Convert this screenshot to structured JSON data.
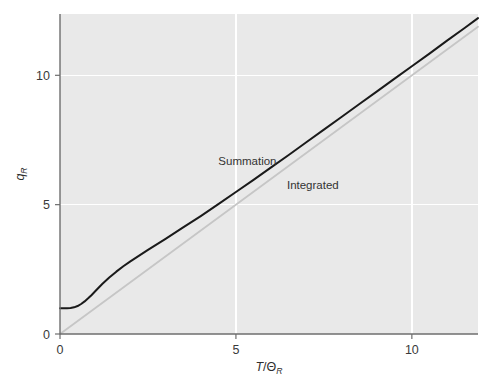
{
  "chart_data": {
    "type": "line",
    "title": "",
    "subtitle": "",
    "xlabel": "T/Θ_R",
    "xlabel_parts": {
      "num": "T",
      "slash": "/",
      "theta": "Θ",
      "sub": "R"
    },
    "ylabel": "q_R",
    "ylabel_parts": {
      "sym": "q",
      "sub": "R"
    },
    "xlim": [
      0,
      11.88
    ],
    "ylim": [
      0,
      12.37
    ],
    "xticks": [
      0,
      5,
      10
    ],
    "xticklabels": [
      "0",
      "5",
      "10"
    ],
    "yticks": [
      0,
      5,
      10
    ],
    "yticklabels": [
      "0",
      "5",
      "10"
    ],
    "grid": true,
    "gridlines_x": [
      5,
      10
    ],
    "gridlines_y": [
      5,
      10
    ],
    "grid_color": "#ffffff",
    "plot_bg": "#e9e9e9",
    "figure_bg": "#ffffff",
    "axis_color": "#6e6e6e",
    "legend": "inline-annotations",
    "legend_position": "inline",
    "annotations": [
      {
        "text": "Summation",
        "x": 4.5,
        "y": 6.55,
        "color": "#333333"
      },
      {
        "text": "Integrated",
        "x": 6.45,
        "y": 5.6,
        "color": "#333333"
      }
    ],
    "series": [
      {
        "name": "Summation",
        "color": "#1a1a1a",
        "width": 2.0,
        "x": [
          0.0,
          0.1,
          0.2,
          0.3,
          0.4,
          0.5,
          0.6,
          0.7,
          0.8,
          0.9,
          1.0,
          1.2,
          1.4,
          1.6,
          1.8,
          2.0,
          2.5,
          3.0,
          3.5,
          4.0,
          4.5,
          5.0,
          5.5,
          6.0,
          6.5,
          7.0,
          7.5,
          8.0,
          8.5,
          9.0,
          9.5,
          10.0,
          10.5,
          11.0,
          11.5,
          11.88
        ],
        "y": [
          1.0,
          1.0,
          1.0,
          1.005,
          1.03,
          1.08,
          1.16,
          1.26,
          1.38,
          1.51,
          1.65,
          1.93,
          2.18,
          2.41,
          2.62,
          2.81,
          3.25,
          3.68,
          4.12,
          4.56,
          5.02,
          5.49,
          5.96,
          6.44,
          6.92,
          7.41,
          7.9,
          8.39,
          8.88,
          9.37,
          9.86,
          10.35,
          10.84,
          11.34,
          11.83,
          12.21
        ]
      },
      {
        "name": "Integrated",
        "color": "#c6c6c6",
        "width": 1.8,
        "x": [
          0.0,
          11.88
        ],
        "y": [
          0.0,
          11.88
        ]
      }
    ]
  },
  "axes_geometry": {
    "left_px": 60,
    "right_px": 478,
    "top_px": 14,
    "bottom_px": 334
  }
}
